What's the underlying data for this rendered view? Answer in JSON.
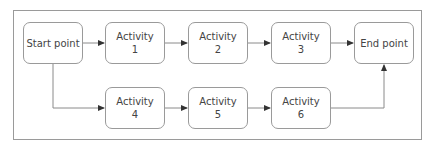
{
  "diagram": {
    "type": "flowchart",
    "nodes": {
      "start": {
        "label": "Start point"
      },
      "a1": {
        "line1": "Activity",
        "line2": "1"
      },
      "a2": {
        "line1": "Activity",
        "line2": "2"
      },
      "a3": {
        "line1": "Activity",
        "line2": "3"
      },
      "a4": {
        "line1": "Activity",
        "line2": "4"
      },
      "a5": {
        "line1": "Activity",
        "line2": "5"
      },
      "a6": {
        "line1": "Activity",
        "line2": "6"
      },
      "end": {
        "label": "End point"
      }
    },
    "edges": [
      [
        "Start point",
        "Activity 1"
      ],
      [
        "Activity 1",
        "Activity 2"
      ],
      [
        "Activity 2",
        "Activity 3"
      ],
      [
        "Activity 3",
        "End point"
      ],
      [
        "Start point",
        "Activity 4"
      ],
      [
        "Activity 4",
        "Activity 5"
      ],
      [
        "Activity 5",
        "Activity 6"
      ],
      [
        "Activity 6",
        "End point"
      ]
    ],
    "colors": {
      "stroke": "#9a9a9a",
      "text": "#444444",
      "arrow": "#333333"
    }
  }
}
